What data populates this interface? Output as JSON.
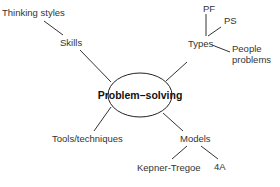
{
  "diagram": {
    "type": "mind-map",
    "center": {
      "label": "Problem–solving"
    },
    "branches": [
      {
        "label": "Skills",
        "children": [
          {
            "label": "Thinking styles"
          }
        ]
      },
      {
        "label": "Types",
        "children": [
          {
            "label": "PF"
          },
          {
            "label": "PS"
          },
          {
            "label": "People",
            "label_line2": "problems"
          }
        ]
      },
      {
        "label": "Tools/techniques",
        "children": []
      },
      {
        "label": "Models",
        "children": [
          {
            "label": "Kepner-Tregoe"
          },
          {
            "label": "4A"
          }
        ]
      }
    ],
    "colors": {
      "line": "#333333",
      "text": "#333333",
      "background": "#ffffff"
    }
  }
}
